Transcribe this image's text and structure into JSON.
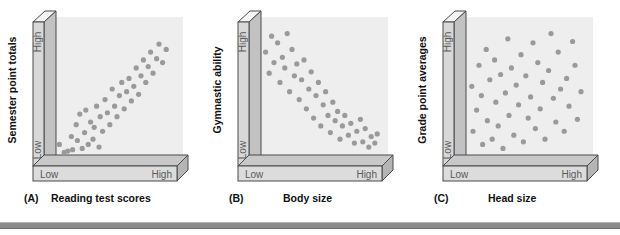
{
  "figure": {
    "colors": {
      "plot_area": "#eeeeee",
      "axis_face": "#d4d4d4",
      "axis_top": "#f2f2f2",
      "axis_side": "#bdbdbd",
      "axis_line": "#4a4a4a",
      "dot": "#9a9a9a",
      "text": "#1a1a1a",
      "tick_text": "#555555",
      "bottom_bar": "#8b8b8b",
      "background": "#ffffff"
    },
    "axis_ticks": {
      "low": "Low",
      "high": "High"
    },
    "bottom_bar_label": "decorative-rule"
  },
  "chart_data": [
    {
      "type": "scatter",
      "panel_letter": "(A)",
      "xlabel": "Reading test scores",
      "ylabel": "Semester point totals",
      "xticks": [
        "Low",
        "High"
      ],
      "yticks": [
        "Low",
        "High"
      ],
      "xlim": [
        0,
        100
      ],
      "ylim": [
        0,
        100
      ],
      "grid": false,
      "legend": "none",
      "correlation": "positive",
      "n_points": 44,
      "points": [
        [
          2,
          8
        ],
        [
          6,
          2
        ],
        [
          9,
          3
        ],
        [
          12,
          14
        ],
        [
          13,
          4
        ],
        [
          16,
          23
        ],
        [
          17,
          11
        ],
        [
          19,
          31
        ],
        [
          21,
          5
        ],
        [
          23,
          17
        ],
        [
          24,
          34
        ],
        [
          26,
          8
        ],
        [
          28,
          25
        ],
        [
          30,
          12
        ],
        [
          31,
          21
        ],
        [
          33,
          37
        ],
        [
          35,
          6
        ],
        [
          36,
          29
        ],
        [
          38,
          18
        ],
        [
          40,
          42
        ],
        [
          42,
          32
        ],
        [
          44,
          23
        ],
        [
          46,
          50
        ],
        [
          48,
          37
        ],
        [
          50,
          29
        ],
        [
          52,
          45
        ],
        [
          54,
          55
        ],
        [
          56,
          35
        ],
        [
          58,
          48
        ],
        [
          60,
          58
        ],
        [
          62,
          41
        ],
        [
          64,
          52
        ],
        [
          66,
          66
        ],
        [
          68,
          46
        ],
        [
          70,
          60
        ],
        [
          72,
          72
        ],
        [
          74,
          55
        ],
        [
          76,
          67
        ],
        [
          78,
          78
        ],
        [
          80,
          62
        ],
        [
          83,
          73
        ],
        [
          85,
          84
        ],
        [
          88,
          70
        ],
        [
          91,
          80
        ]
      ]
    },
    {
      "type": "scatter",
      "panel_letter": "(B)",
      "xlabel": "Body size",
      "ylabel": "Gymnastic ability",
      "xticks": [
        "Low",
        "High"
      ],
      "yticks": [
        "Low",
        "High"
      ],
      "xlim": [
        0,
        100
      ],
      "ylim": [
        0,
        100
      ],
      "grid": false,
      "legend": "none",
      "correlation": "negative",
      "n_points": 44,
      "points": [
        [
          3,
          78
        ],
        [
          6,
          62
        ],
        [
          8,
          90
        ],
        [
          10,
          70
        ],
        [
          13,
          85
        ],
        [
          15,
          55
        ],
        [
          17,
          74
        ],
        [
          19,
          66
        ],
        [
          21,
          92
        ],
        [
          23,
          48
        ],
        [
          25,
          80
        ],
        [
          27,
          60
        ],
        [
          29,
          69
        ],
        [
          31,
          42
        ],
        [
          33,
          57
        ],
        [
          35,
          72
        ],
        [
          37,
          35
        ],
        [
          39,
          50
        ],
        [
          41,
          63
        ],
        [
          43,
          28
        ],
        [
          45,
          45
        ],
        [
          47,
          55
        ],
        [
          49,
          22
        ],
        [
          51,
          38
        ],
        [
          53,
          48
        ],
        [
          55,
          30
        ],
        [
          57,
          17
        ],
        [
          59,
          40
        ],
        [
          61,
          26
        ],
        [
          63,
          33
        ],
        [
          65,
          12
        ],
        [
          67,
          22
        ],
        [
          69,
          30
        ],
        [
          72,
          15
        ],
        [
          74,
          24
        ],
        [
          77,
          9
        ],
        [
          79,
          18
        ],
        [
          82,
          27
        ],
        [
          84,
          10
        ],
        [
          86,
          20
        ],
        [
          89,
          6
        ],
        [
          91,
          14
        ],
        [
          94,
          9
        ],
        [
          96,
          16
        ]
      ]
    },
    {
      "type": "scatter",
      "panel_letter": "(C)",
      "xlabel": "Head size",
      "ylabel": "Grade point averages",
      "xticks": [
        "Low",
        "High"
      ],
      "yticks": [
        "Low",
        "High"
      ],
      "xlim": [
        0,
        100
      ],
      "ylim": [
        0,
        100
      ],
      "grid": false,
      "legend": "none",
      "correlation": "none",
      "n_points": 46,
      "points": [
        [
          4,
          52
        ],
        [
          5,
          18
        ],
        [
          8,
          34
        ],
        [
          10,
          68
        ],
        [
          12,
          45
        ],
        [
          13,
          8
        ],
        [
          16,
          80
        ],
        [
          17,
          26
        ],
        [
          19,
          57
        ],
        [
          21,
          12
        ],
        [
          23,
          72
        ],
        [
          24,
          40
        ],
        [
          26,
          22
        ],
        [
          28,
          61
        ],
        [
          30,
          5
        ],
        [
          32,
          47
        ],
        [
          34,
          88
        ],
        [
          35,
          30
        ],
        [
          37,
          66
        ],
        [
          39,
          15
        ],
        [
          41,
          53
        ],
        [
          43,
          38
        ],
        [
          45,
          76
        ],
        [
          47,
          10
        ],
        [
          49,
          60
        ],
        [
          51,
          28
        ],
        [
          53,
          44
        ],
        [
          55,
          85
        ],
        [
          57,
          20
        ],
        [
          59,
          70
        ],
        [
          61,
          35
        ],
        [
          63,
          55
        ],
        [
          65,
          12
        ],
        [
          68,
          64
        ],
        [
          70,
          92
        ],
        [
          72,
          43
        ],
        [
          74,
          25
        ],
        [
          76,
          78
        ],
        [
          78,
          50
        ],
        [
          81,
          18
        ],
        [
          83,
          58
        ],
        [
          85,
          37
        ],
        [
          88,
          86
        ],
        [
          90,
          68
        ],
        [
          92,
          27
        ],
        [
          95,
          48
        ]
      ]
    }
  ]
}
